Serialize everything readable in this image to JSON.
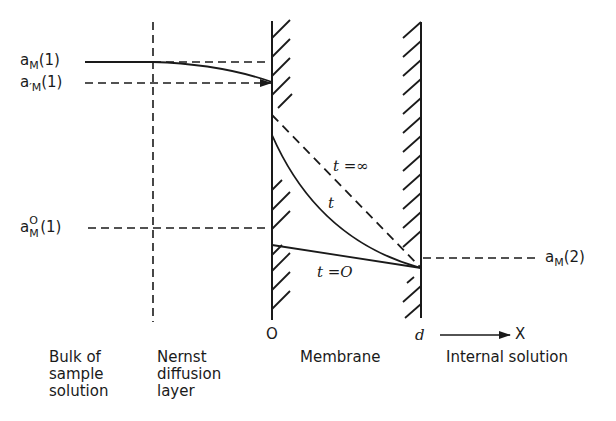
{
  "left_labels": {
    "aM1": {
      "base": "a",
      "sub": "M",
      "tail": "(1)"
    },
    "aM1_prime": {
      "base": "a",
      "prime": "′",
      "sub": "M",
      "tail": "(1)"
    },
    "aM0_1": {
      "base": "a",
      "sup": "O",
      "sub": "M",
      "tail": "(1)"
    }
  },
  "right_labels": {
    "aM2": {
      "base": "a",
      "sub": "M",
      "tail": "(2)"
    }
  },
  "curve_labels": {
    "t_infinity": "t =∞",
    "t": "t",
    "t_zero": "t =O"
  },
  "axis": {
    "origin": "O",
    "d": "d",
    "x": "X"
  },
  "regions": {
    "bulk": [
      "Bulk of",
      "sample",
      "solution"
    ],
    "nernst": [
      "Nernst",
      "diffusion",
      "layer"
    ],
    "membrane": [
      "Membrane"
    ],
    "internal": [
      "Internal solution"
    ]
  },
  "colors": {
    "ink": "#1a1a1a",
    "background": "#ffffff"
  }
}
